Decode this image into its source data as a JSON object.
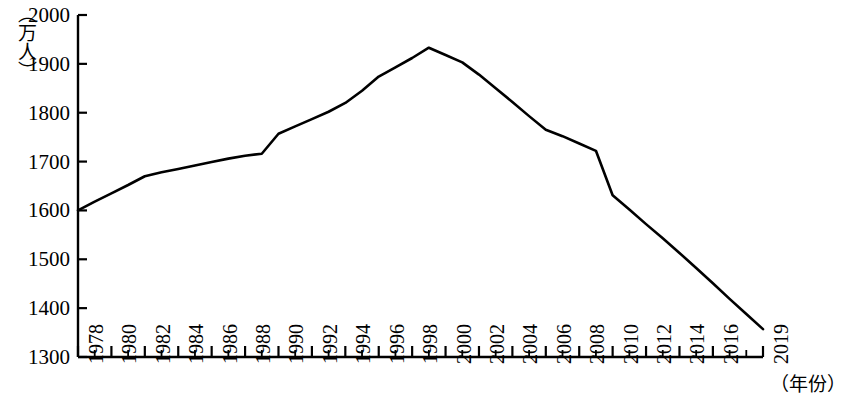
{
  "chart_data": {
    "type": "line",
    "title": "",
    "subtitle": "",
    "xlabel": "（年份）",
    "ylabel": "（万人）",
    "xlim": [
      1978,
      2019
    ],
    "ylim": [
      1300,
      2000
    ],
    "grid": false,
    "legend": null,
    "y_ticks": [
      1300,
      1400,
      1500,
      1600,
      1700,
      1800,
      1900,
      2000
    ],
    "x_ticks": [
      1978,
      1980,
      1982,
      1984,
      1986,
      1988,
      1990,
      1992,
      1994,
      1996,
      1998,
      2000,
      2002,
      2004,
      2006,
      2008,
      2010,
      2012,
      2014,
      2016,
      2019
    ],
    "x_tick_labels": [
      "1978",
      "1980",
      "1982",
      "1984",
      "1986",
      "1988",
      "1990",
      "1992",
      "1994",
      "1996",
      "1998",
      "2000",
      "2002",
      "2004",
      "2006",
      "2008",
      "2010",
      "2012",
      "2014",
      "2016",
      "2019"
    ],
    "x_minor_tick_step": 1,
    "line_color": "#000000",
    "line_width": 2.6,
    "series": [
      {
        "name": "人口",
        "x": [
          1978,
          1979,
          1980,
          1981,
          1982,
          1983,
          1984,
          1985,
          1986,
          1987,
          1988,
          1989,
          1990,
          1991,
          1992,
          1993,
          1994,
          1995,
          1996,
          1997,
          1998,
          1999,
          2000,
          2001,
          2002,
          2003,
          2004,
          2005,
          2006,
          2007,
          2008,
          2009,
          2010,
          2011,
          2012,
          2013,
          2014,
          2015,
          2016,
          2017,
          2018,
          2019
        ],
        "values": [
          1600,
          1618,
          1635,
          1652,
          1670,
          1678,
          1685,
          1692,
          1699,
          1706,
          1712,
          1716,
          1757,
          1772,
          1787,
          1802,
          1820,
          1845,
          1874,
          1893,
          1912,
          1933,
          1918,
          1903,
          1878,
          1850,
          1822,
          1793,
          1765,
          1752,
          1737,
          1722,
          1631,
          1602,
          1572,
          1543,
          1513,
          1482,
          1451,
          1419,
          1388,
          1357
        ]
      }
    ],
    "annotations": []
  }
}
